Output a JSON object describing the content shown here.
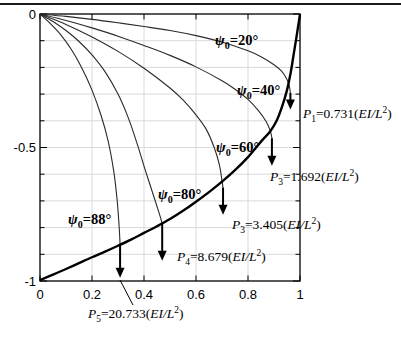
{
  "figure": {
    "background": "#ffffff",
    "top_rule_color": "#1a1a1a",
    "grid_color": "#d9d9d9",
    "curve_color": "#2a2a2a",
    "envelope_color": "#000000"
  },
  "chart_data": {
    "type": "line",
    "title": "",
    "xlabel": "",
    "ylabel": "",
    "xlim": [
      0,
      1
    ],
    "ylim": [
      -1,
      0
    ],
    "grid": {
      "x": [
        0.2,
        0.4,
        0.6,
        0.8
      ],
      "y": [
        -0.1,
        -0.2,
        -0.3,
        -0.4,
        -0.5,
        -0.6,
        -0.7,
        -0.8,
        -0.9
      ]
    },
    "x_ticks": [
      {
        "v": 0,
        "label": "0"
      },
      {
        "v": 0.2,
        "label": "0.2"
      },
      {
        "v": 0.4,
        "label": "0.4"
      },
      {
        "v": 0.6,
        "label": "0.6"
      },
      {
        "v": 0.8,
        "label": "0.8"
      },
      {
        "v": 1,
        "label": "1"
      }
    ],
    "y_ticks": [
      {
        "v": 0,
        "label": "0"
      },
      {
        "v": -0.5,
        "label": "-0.5"
      },
      {
        "v": -1,
        "label": "-1"
      }
    ],
    "y_minor_ticks": [
      -0.1,
      -0.2,
      -0.3,
      -0.4,
      -0.6,
      -0.7,
      -0.8,
      -0.9
    ],
    "series": [
      {
        "name": "psi0-20deg",
        "points": [
          [
            0,
            0
          ],
          [
            0.1,
            -0.009
          ],
          [
            0.2,
            -0.02
          ],
          [
            0.3,
            -0.033
          ],
          [
            0.4,
            -0.047
          ],
          [
            0.5,
            -0.062
          ],
          [
            0.6,
            -0.081
          ],
          [
            0.7,
            -0.105
          ],
          [
            0.8,
            -0.138
          ],
          [
            0.85,
            -0.16
          ],
          [
            0.9,
            -0.19
          ],
          [
            0.93,
            -0.215
          ],
          [
            0.95,
            -0.245
          ],
          [
            0.959,
            -0.27
          ],
          [
            0.963,
            -0.295
          ]
        ]
      },
      {
        "name": "psi0-40deg",
        "points": [
          [
            0,
            0
          ],
          [
            0.1,
            -0.024
          ],
          [
            0.2,
            -0.052
          ],
          [
            0.3,
            -0.083
          ],
          [
            0.4,
            -0.118
          ],
          [
            0.5,
            -0.155
          ],
          [
            0.6,
            -0.198
          ],
          [
            0.7,
            -0.25
          ],
          [
            0.75,
            -0.282
          ],
          [
            0.8,
            -0.32
          ],
          [
            0.84,
            -0.362
          ],
          [
            0.868,
            -0.4
          ],
          [
            0.885,
            -0.435
          ],
          [
            0.892,
            -0.465
          ]
        ]
      },
      {
        "name": "psi0-60deg",
        "points": [
          [
            0,
            0
          ],
          [
            0.1,
            -0.039
          ],
          [
            0.2,
            -0.086
          ],
          [
            0.3,
            -0.14
          ],
          [
            0.4,
            -0.203
          ],
          [
            0.5,
            -0.277
          ],
          [
            0.55,
            -0.322
          ],
          [
            0.6,
            -0.378
          ],
          [
            0.64,
            -0.433
          ],
          [
            0.67,
            -0.5
          ],
          [
            0.69,
            -0.565
          ],
          [
            0.7,
            -0.625
          ],
          [
            0.704,
            -0.65
          ]
        ]
      },
      {
        "name": "psi0-80deg",
        "points": [
          [
            0,
            0
          ],
          [
            0.05,
            -0.028
          ],
          [
            0.1,
            -0.062
          ],
          [
            0.15,
            -0.103
          ],
          [
            0.2,
            -0.153
          ],
          [
            0.25,
            -0.216
          ],
          [
            0.3,
            -0.3
          ],
          [
            0.34,
            -0.39
          ],
          [
            0.375,
            -0.49
          ],
          [
            0.405,
            -0.585
          ],
          [
            0.435,
            -0.675
          ],
          [
            0.458,
            -0.745
          ],
          [
            0.47,
            -0.785
          ]
        ]
      },
      {
        "name": "psi0-88deg",
        "points": [
          [
            0,
            0
          ],
          [
            0.04,
            -0.036
          ],
          [
            0.08,
            -0.078
          ],
          [
            0.12,
            -0.132
          ],
          [
            0.16,
            -0.2
          ],
          [
            0.2,
            -0.285
          ],
          [
            0.235,
            -0.38
          ],
          [
            0.262,
            -0.475
          ],
          [
            0.283,
            -0.585
          ],
          [
            0.296,
            -0.69
          ],
          [
            0.304,
            -0.79
          ],
          [
            0.308,
            -0.862
          ]
        ]
      },
      {
        "name": "tip-locus-envelope",
        "thick": true,
        "points": [
          [
            0,
            -0.997
          ],
          [
            0.05,
            -0.976
          ],
          [
            0.1,
            -0.955
          ],
          [
            0.15,
            -0.933
          ],
          [
            0.2,
            -0.911
          ],
          [
            0.25,
            -0.89
          ],
          [
            0.3,
            -0.868
          ],
          [
            0.35,
            -0.845
          ],
          [
            0.4,
            -0.82
          ],
          [
            0.45,
            -0.795
          ],
          [
            0.5,
            -0.768
          ],
          [
            0.55,
            -0.737
          ],
          [
            0.6,
            -0.703
          ],
          [
            0.65,
            -0.667
          ],
          [
            0.7,
            -0.628
          ],
          [
            0.75,
            -0.585
          ],
          [
            0.8,
            -0.536
          ],
          [
            0.85,
            -0.478
          ],
          [
            0.885,
            -0.44
          ],
          [
            0.91,
            -0.4
          ],
          [
            0.93,
            -0.35
          ],
          [
            0.95,
            -0.285
          ],
          [
            0.965,
            -0.215
          ],
          [
            0.975,
            -0.155
          ],
          [
            0.985,
            -0.095
          ],
          [
            0.993,
            -0.045
          ],
          [
            1,
            0
          ]
        ]
      }
    ],
    "arrows": [
      {
        "id": "arrow-P1",
        "x": 0.963,
        "y_start": -0.295,
        "y_tip": -0.358
      },
      {
        "id": "arrow-P3a",
        "x": 0.892,
        "y_start": -0.465,
        "y_tip": -0.568
      },
      {
        "id": "arrow-P3b",
        "x": 0.704,
        "y_start": -0.65,
        "y_tip": -0.752
      },
      {
        "id": "arrow-P4",
        "x": 0.47,
        "y_start": -0.785,
        "y_tip": -0.924
      },
      {
        "id": "arrow-P5",
        "x": 0.308,
        "y_start": -0.862,
        "y_tip": -0.988
      }
    ],
    "annotations": [
      {
        "id": "psi-20",
        "cls": "psi",
        "px": [
          215,
          45
        ],
        "parts": [
          [
            "i",
            "ψ"
          ],
          [
            "sub",
            "0"
          ],
          [
            "n",
            "=20°"
          ]
        ]
      },
      {
        "id": "psi-40",
        "cls": "psi",
        "px": [
          237,
          95
        ],
        "parts": [
          [
            "i",
            "ψ"
          ],
          [
            "sub",
            "0"
          ],
          [
            "n",
            "=40°"
          ]
        ]
      },
      {
        "id": "psi-60",
        "cls": "psi",
        "px": [
          216,
          152
        ],
        "parts": [
          [
            "i",
            "ψ"
          ],
          [
            "sub",
            "0"
          ],
          [
            "n",
            "=60°"
          ]
        ]
      },
      {
        "id": "psi-80",
        "cls": "psi",
        "px": [
          158,
          199
        ],
        "parts": [
          [
            "i",
            "ψ"
          ],
          [
            "sub",
            "0"
          ],
          [
            "n",
            "=80°"
          ]
        ]
      },
      {
        "id": "psi-88",
        "cls": "psi",
        "px": [
          68,
          224
        ],
        "parts": [
          [
            "i",
            "ψ"
          ],
          [
            "sub",
            "0"
          ],
          [
            "n",
            "=88°"
          ]
        ]
      },
      {
        "id": "p1-label",
        "cls": "pval",
        "px": [
          303,
          118
        ],
        "parts": [
          [
            "i",
            "P"
          ],
          [
            "sub",
            "1"
          ],
          [
            "n",
            "=0.731("
          ],
          [
            "i",
            "EI/L"
          ],
          [
            "sup",
            "2"
          ],
          [
            "n",
            ")"
          ]
        ]
      },
      {
        "id": "p3a-label",
        "cls": "pval",
        "px": [
          270,
          181
        ],
        "parts": [
          [
            "i",
            "P"
          ],
          [
            "sub",
            "3"
          ],
          [
            "n",
            "=1.692("
          ],
          [
            "i",
            "EI/L"
          ],
          [
            "sup",
            "2"
          ],
          [
            "n",
            ")"
          ]
        ]
      },
      {
        "id": "p3b-label",
        "cls": "pval",
        "px": [
          232,
          229
        ],
        "parts": [
          [
            "i",
            "P"
          ],
          [
            "sub",
            "3"
          ],
          [
            "n",
            "=3.405("
          ],
          [
            "i",
            "EI/L"
          ],
          [
            "sup",
            "2"
          ],
          [
            "n",
            ")"
          ]
        ]
      },
      {
        "id": "p4-label",
        "cls": "pval",
        "px": [
          177,
          261
        ],
        "parts": [
          [
            "i",
            "P"
          ],
          [
            "sub",
            "4"
          ],
          [
            "n",
            "=8.679("
          ],
          [
            "i",
            "EI/L"
          ],
          [
            "sup",
            "2"
          ],
          [
            "n",
            ")"
          ]
        ]
      },
      {
        "id": "p5-label",
        "cls": "pval",
        "px": [
          88,
          318
        ],
        "parts": [
          [
            "i",
            "P"
          ],
          [
            "sub",
            "5"
          ],
          [
            "n",
            "=20.733("
          ],
          [
            "i",
            "EI/L"
          ],
          [
            "sup",
            "2"
          ],
          [
            "n",
            ")"
          ]
        ],
        "leader_px": [
          120,
          280,
          133,
          305
        ]
      }
    ]
  }
}
